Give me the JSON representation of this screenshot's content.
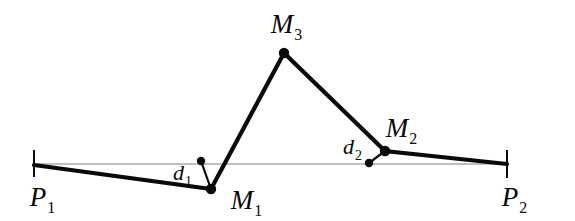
{
  "figure": {
    "kind": "line-simplification-diagram",
    "background_color": "#ffffff",
    "stroke_color": "#0a0a0a",
    "chord_color": "#808080",
    "thick_stroke_width": 4.2,
    "chord_stroke_width": 1.1,
    "dot_radius": 5.2,
    "small_dot_radius": 4.2,
    "tick_stroke_width": 2.0
  },
  "geometry": {
    "chord": {
      "x1": 34,
      "y1": 164,
      "x2": 507,
      "y2": 164
    },
    "ticks": [
      {
        "name": "tick-p1",
        "x": 34,
        "y_top": 150,
        "y_bottom": 177
      },
      {
        "name": "tick-p2",
        "x": 507,
        "y_top": 150,
        "y_bottom": 178
      }
    ],
    "polyline_points": "34,165 211,189 284,53 385,151 507,164",
    "vertices": [
      {
        "id": "P1",
        "x": 34,
        "y": 165,
        "dot": false
      },
      {
        "id": "M1",
        "x": 211,
        "y": 189,
        "dot": true
      },
      {
        "id": "M3",
        "x": 284,
        "y": 53,
        "dot": true
      },
      {
        "id": "M2",
        "x": 385,
        "y": 151,
        "dot": true
      },
      {
        "id": "P2",
        "x": 507,
        "y": 164,
        "dot": false
      }
    ],
    "offsets": [
      {
        "id": "d1",
        "foot": {
          "x": 201,
          "y": 161
        },
        "vertex": {
          "x": 211,
          "y": 189
        }
      },
      {
        "id": "d2",
        "foot": {
          "x": 369,
          "y": 163
        },
        "vertex": {
          "x": 385,
          "y": 151
        }
      }
    ]
  },
  "labels": {
    "p1": {
      "base": "P",
      "sub": "1",
      "x": 42,
      "y": 197
    },
    "p2": {
      "base": "P",
      "sub": "2",
      "x": 514,
      "y": 197
    },
    "m1": {
      "base": "M",
      "sub": "1",
      "x": 246,
      "y": 200
    },
    "m2": {
      "base": "M",
      "sub": "2",
      "x": 401,
      "y": 128
    },
    "m3": {
      "base": "M",
      "sub": "3",
      "x": 286,
      "y": 24
    },
    "d1": {
      "base": "d",
      "sub": "1",
      "x": 182,
      "y": 173
    },
    "d2": {
      "base": "d",
      "sub": "2",
      "x": 352,
      "y": 147
    }
  }
}
